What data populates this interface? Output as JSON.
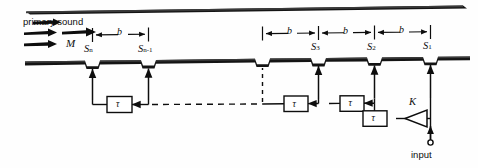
{
  "figure": {
    "type": "acoustic-waveguide-tapped-delay-line-schematic",
    "primary_sound_label": "primary sound",
    "mach_label": "M",
    "input_label": "input",
    "gain_label": "K",
    "delay_label": "τ",
    "spacing_label": "b",
    "slot_labels": [
      "S_n",
      "S_n-1",
      "S_3",
      "S_2",
      "S_1"
    ],
    "slot_labels_render": [
      {
        "base": "S",
        "sub": "n"
      },
      {
        "base": "S",
        "sub": "n-1"
      },
      {
        "base": "S",
        "sub": "3"
      },
      {
        "base": "S",
        "sub": "2"
      },
      {
        "base": "S",
        "sub": "1"
      }
    ],
    "spacing_labels": [
      "b",
      "b",
      "b",
      "b"
    ],
    "delay_boxes": [
      "τ",
      "τ",
      "τ",
      "τ"
    ],
    "colors": {
      "ink": "#0d0d0d",
      "wall": "#141414",
      "background": "#ffffff"
    }
  }
}
